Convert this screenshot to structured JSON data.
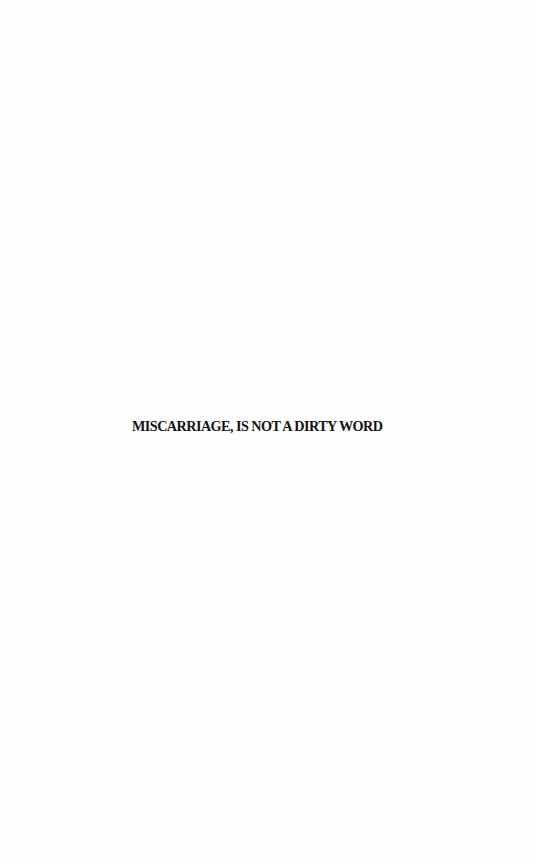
{
  "page": {
    "title": "MISCARRIAGE, IS NOT A DIRTY WORD"
  },
  "colors": {
    "background": "#fefefe",
    "text": "#141414"
  }
}
